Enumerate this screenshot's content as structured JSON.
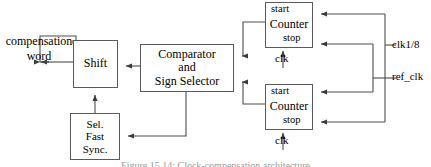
{
  "diagram": {
    "type": "block-diagram",
    "background": "#ffffff",
    "line_color": "#4d4d4d",
    "box_border_color": "#5a5a5a",
    "text_color": "#000000",
    "blocks": [
      {
        "id": "shift",
        "lines": [
          "Shift"
        ]
      },
      {
        "id": "sel-fast-sync",
        "lines": [
          "Sel.",
          "Fast",
          "Sync."
        ]
      },
      {
        "id": "comparator",
        "lines": [
          "Comparator",
          "and",
          "Sign Selector"
        ]
      },
      {
        "id": "counter-top",
        "lines": [
          "Counter"
        ]
      },
      {
        "id": "counter-bottom",
        "lines": [
          "Counter"
        ]
      }
    ],
    "labels": {
      "compensation_word": "compensation\nword",
      "compensation_word_line1": "compensation",
      "compensation_word_line2": "word",
      "start_top": "start",
      "stop_top": "stop",
      "clk_top": "clk",
      "start_bottom": "start",
      "stop_bottom": "stop",
      "clk_bottom": "clk",
      "clk_div8": "clk1/8",
      "ref_clk": "ref_clk"
    },
    "block_text": {
      "shift": "Shift",
      "sel_fast_sync_l1": "Sel.",
      "sel_fast_sync_l2": "Fast",
      "sel_fast_sync_l3": "Sync.",
      "comparator_l1": "Comparator",
      "comparator_l2": "and",
      "comparator_l3": "Sign Selector",
      "counter_top": "Counter",
      "counter_bottom": "Counter"
    },
    "caption": "Figure 15.14: Clock-compensation architecture",
    "signals": [
      {
        "name": "compensation-word-out",
        "from": "shift",
        "to": "compensation word label"
      },
      {
        "name": "comparator-to-shift",
        "from": "comparator",
        "to": "shift"
      },
      {
        "name": "selfast-to-shift",
        "from": "sel-fast-sync",
        "to": "shift"
      },
      {
        "name": "comparator-to-selfast",
        "from": "comparator",
        "to": "sel-fast-sync"
      },
      {
        "name": "counter-top-to-comparator",
        "from": "counter-top",
        "to": "comparator"
      },
      {
        "name": "counter-bottom-to-comparator",
        "from": "counter-bottom",
        "to": "comparator"
      },
      {
        "name": "clk1/8-to-start-top",
        "from": "clk1/8",
        "to": "counter-top.start"
      },
      {
        "name": "clk1/8-to-stop-bottom",
        "from": "clk1/8",
        "to": "counter-bottom.stop"
      },
      {
        "name": "ref_clk-to-stop-top",
        "from": "ref_clk",
        "to": "counter-top.stop"
      },
      {
        "name": "ref_clk-to-start-bottom",
        "from": "ref_clk",
        "to": "counter-bottom.start"
      },
      {
        "name": "clk-to-counter-top",
        "from": "clk",
        "to": "counter-top"
      },
      {
        "name": "clk-to-counter-bottom",
        "from": "clk",
        "to": "counter-bottom"
      }
    ]
  }
}
